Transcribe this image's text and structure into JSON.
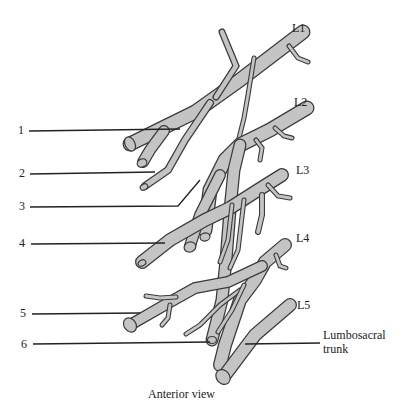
{
  "figure": {
    "caption": "Anterior view",
    "colors": {
      "nerve_fill": "#c4c4c4",
      "outline": "#3a3a3a",
      "leader_line": "#222222"
    }
  },
  "levels": [
    {
      "id": "L1",
      "label": "L1"
    },
    {
      "id": "L2",
      "label": "L2"
    },
    {
      "id": "L3",
      "label": "L3"
    },
    {
      "id": "L4",
      "label": "L4"
    },
    {
      "id": "L5",
      "label": "L5"
    }
  ],
  "callouts": [
    {
      "number": "1"
    },
    {
      "number": "2"
    },
    {
      "number": "3"
    },
    {
      "number": "4"
    },
    {
      "number": "5"
    },
    {
      "number": "6"
    }
  ],
  "right_labels": {
    "lumbosacral_line1": "Lumbosacral",
    "lumbosacral_line2": "trunk"
  }
}
